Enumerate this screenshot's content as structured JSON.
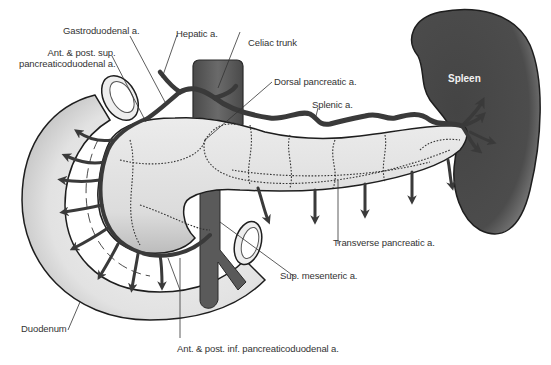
{
  "figure": {
    "colors": {
      "artery": "#3a3a3a",
      "organ_fill": "#e4e4e4",
      "organ_shadow": "#bdbdbd",
      "spleen": "#4a4a4a",
      "aorta": "#5a5a5a",
      "leader_line": "#333333",
      "label_text": "#333333"
    }
  },
  "labels": {
    "gastroduodenal": "Gastroduodenal a.",
    "hepatic": "Hepatic a.",
    "celiac_trunk": "Celiac trunk",
    "ant_post_sup_pd": "Ant. & post. sup.\npancreaticoduodenal a.",
    "dorsal_pancreatic": "Dorsal pancreatic a.",
    "splenic": "Splenic a.",
    "spleen": "Spleen",
    "transverse_pancreatic": "Transverse pancreatic a.",
    "sup_mesenteric": "Sup. mesenteric a.",
    "duodenum": "Duodenum",
    "ant_post_inf_pd": "Ant. & post. inf. pancreaticoduodenal a."
  }
}
